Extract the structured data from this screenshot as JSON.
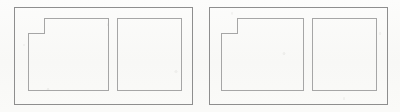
{
  "image": {
    "title": "Two-panel rectilinear line drawing",
    "width": 400,
    "height": 112,
    "background_color": "#fbfbfa",
    "line_color": "#8e8e8e",
    "line_color_light": "#a6a6a6",
    "stroke_width": 1,
    "style": "scanned monochrome line art"
  },
  "panels": [
    {
      "id": "left-panel",
      "label": "Left panel",
      "frame": {
        "x": 14,
        "y": 7,
        "width": 178,
        "height": 97
      },
      "shapes": [
        {
          "id": "left-notched-square",
          "label": "Square with small corner notch",
          "type": "notched-rectangle",
          "notch": "small square cut at top-left corner",
          "bounds": {
            "x": 28,
            "y": 18,
            "width": 80,
            "height": 72
          },
          "notch_size": {
            "width": 16,
            "height": 15
          },
          "points": "44,18 108,18 108,90 28,90 28,33 44,33"
        },
        {
          "id": "left-plain-rectangle",
          "label": "Plain rectangle",
          "type": "rectangle",
          "bounds": {
            "x": 117,
            "y": 18,
            "width": 64,
            "height": 72
          },
          "points": "117,18 181,18 181,90 117,90"
        }
      ]
    },
    {
      "id": "right-panel",
      "label": "Right panel",
      "frame": {
        "x": 209,
        "y": 7,
        "width": 178,
        "height": 97
      },
      "shapes": [
        {
          "id": "right-stepped-shape",
          "label": "Rectangle with stepped corner notch",
          "type": "notched-rectangle",
          "notch": "large stepped cut at top-left corner",
          "bounds": {
            "x": 221,
            "y": 18,
            "width": 82,
            "height": 72
          },
          "notch_size": {
            "width": 16,
            "height": 15
          },
          "points": "237,18 303,18 303,90 221,90 221,33 237,33"
        },
        {
          "id": "right-plain-rectangle",
          "label": "Plain rectangle",
          "type": "rectangle",
          "bounds": {
            "x": 312,
            "y": 18,
            "width": 64,
            "height": 72
          },
          "points": "312,18 376,18 376,90 312,90"
        }
      ]
    }
  ]
}
